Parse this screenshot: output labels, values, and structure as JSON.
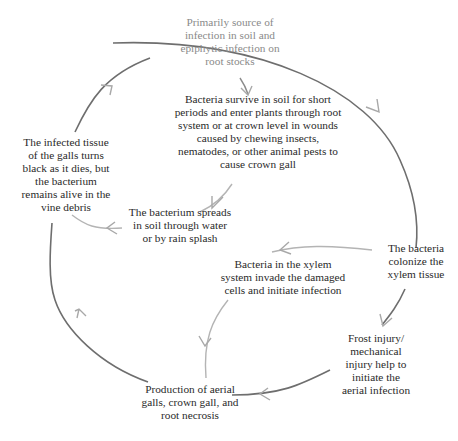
{
  "diagram": {
    "type": "disease-cycle",
    "colors": {
      "text": "#2a2a2a",
      "text_muted": "#8a8a8a",
      "outer_arrow": "#6e6e6e",
      "inner_arrow": "#b4b4b4",
      "arrowhead": "#a8a8a8"
    },
    "nodes": [
      {
        "id": "primary-source",
        "text": "Primarily source of\ninfection in soil and\nepiphytic infection on\nroot stocks"
      },
      {
        "id": "survive-in-soil",
        "text": "Bacteria survive in soil for short\nperiods and enter plants through root\nsystem or at crown level in wounds\ncaused by chewing insects,\nnematodes, or other animal pests to\ncause crown gall"
      },
      {
        "id": "colonize-xylem",
        "text": "The bacteria\ncolonize the\nxylem tissue"
      },
      {
        "id": "frost-injury",
        "text": "Frost injury/\nmechanical\ninjury help to\ninitiate the\naerial infection"
      },
      {
        "id": "production-galls",
        "text": "Production of aerial\ngalls, crown gall, and\nroot necrosis"
      },
      {
        "id": "infected-tissue",
        "text": "The infected tissue\nof the galls turns\nblack as it dies, but\nthe bacterium\nremains alive in the\nvine debris"
      },
      {
        "id": "spreads-in-soil",
        "text": "The bacterium spreads\nin soil through water\nor by rain splash"
      },
      {
        "id": "xylem-invade",
        "text": "Bacteria in the xylem\nsystem invade the damaged\ncells and initiate infection"
      }
    ],
    "edges": [
      {
        "from": "primary-source",
        "to": "survive-in-soil"
      },
      {
        "from": "primary-source",
        "to": "colonize-xylem"
      },
      {
        "from": "survive-in-soil",
        "to": "spreads-in-soil"
      },
      {
        "from": "colonize-xylem",
        "to": "xylem-invade"
      },
      {
        "from": "colonize-xylem",
        "to": "frost-injury"
      },
      {
        "from": "frost-injury",
        "to": "production-galls"
      },
      {
        "from": "xylem-invade",
        "to": "production-galls"
      },
      {
        "from": "production-galls",
        "to": "infected-tissue"
      },
      {
        "from": "spreads-in-soil",
        "to": "infected-tissue"
      },
      {
        "from": "infected-tissue",
        "to": "primary-source"
      }
    ]
  }
}
